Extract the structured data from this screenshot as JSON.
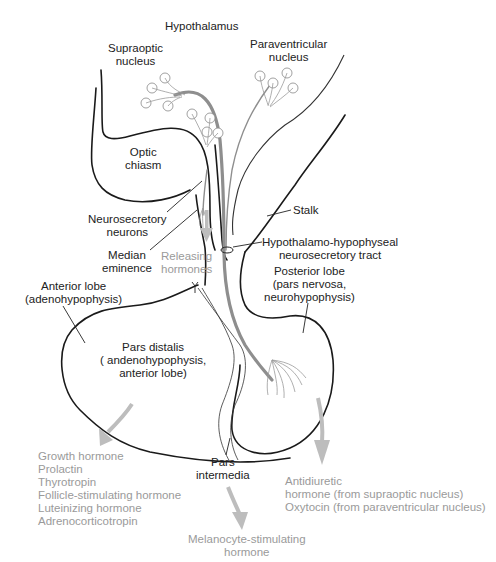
{
  "diagram": {
    "colors": {
      "outline": "#1a1a1a",
      "tract": "#8e8e8e",
      "hormone_text": "#9a9a9a",
      "arrow": "#bdbdbd"
    },
    "labels": {
      "hypothalamus": "Hypothalamus",
      "supraoptic": [
        "Supraoptic",
        "nucleus"
      ],
      "paraventricular": [
        "Paraventricular",
        "nucleus"
      ],
      "optic_chiasm": [
        "Optic",
        "chiasm"
      ],
      "neurosecretory_neurons": [
        "Neurosecretory",
        "neurons"
      ],
      "median_eminence": [
        "Median",
        "eminence"
      ],
      "releasing_hormones": [
        "Releasing",
        "hormones"
      ],
      "stalk": "Stalk",
      "tract": [
        "Hypothalamo-hypophyseal",
        "neurosecretory tract"
      ],
      "anterior_lobe": [
        "Anterior lobe",
        "(adenohypophysis)"
      ],
      "posterior_lobe": [
        "Posterior lobe",
        "(pars nervosa,",
        "neurohypophysis)"
      ],
      "pars_distalis": [
        "Pars distalis",
        "( andenohypophysis,",
        "anterior lobe)"
      ],
      "pars_intermedia": [
        "Pars",
        "intermedia"
      ]
    },
    "hormones": {
      "anterior": [
        "Growth hormone",
        "Prolactin",
        "Thyrotropin",
        "Follicle-stimulating hormone",
        "Luteinizing hormone",
        "Adrenocorticotropin"
      ],
      "intermediate": [
        "Melanocyte-stimulating",
        "hormone"
      ],
      "posterior": [
        "Antidiuretic",
        "hormone (from supraoptic nucleus)",
        "Oxytocin (from paraventricular nucleus)"
      ]
    }
  }
}
